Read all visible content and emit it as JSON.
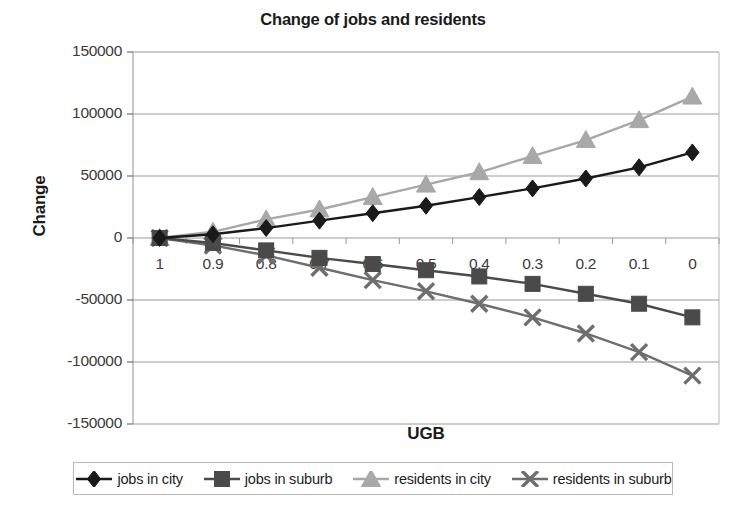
{
  "chart_data": {
    "type": "line",
    "title": "Change of jobs and residents",
    "xlabel": "UGB",
    "ylabel": "Change",
    "categories": [
      "1",
      "0.9",
      "0.8",
      "0.7",
      "0.6",
      "0.5",
      "0.4",
      "0.3",
      "0.2",
      "0.1",
      "0"
    ],
    "ylim": [
      -150000,
      150000
    ],
    "ytick_labels": [
      "150000",
      "100000",
      "50000",
      "0",
      "-50000",
      "-100000",
      "-150000"
    ],
    "ytick_values": [
      150000,
      100000,
      50000,
      0,
      -50000,
      -100000,
      -150000
    ],
    "grid": true,
    "legend_position": "bottom",
    "series": [
      {
        "name": "jobs in city",
        "marker": "diamond",
        "color": "#1a1a1a",
        "values": [
          0,
          3000,
          8000,
          14000,
          20000,
          26000,
          33000,
          40000,
          48000,
          57000,
          69000
        ]
      },
      {
        "name": "jobs in suburb",
        "marker": "square",
        "color": "#4a4a4a",
        "values": [
          0,
          -4000,
          -10000,
          -16000,
          -21000,
          -26000,
          -31000,
          -37000,
          -45000,
          -53000,
          -64000
        ]
      },
      {
        "name": "residents in city",
        "marker": "triangle",
        "color": "#a8a8a8",
        "values": [
          0,
          5000,
          15000,
          23000,
          33000,
          43000,
          53000,
          66000,
          79000,
          95000,
          114000
        ]
      },
      {
        "name": "residents in suburb",
        "marker": "cross",
        "color": "#6e6e6e",
        "values": [
          0,
          -6000,
          -14000,
          -24000,
          -34000,
          -43000,
          -53000,
          -64000,
          -77000,
          -92000,
          -111000
        ]
      }
    ]
  },
  "legend": {
    "items": [
      {
        "label": "jobs in city"
      },
      {
        "label": "jobs in suburb"
      },
      {
        "label": "residents in city"
      },
      {
        "label": "residents in suburb"
      }
    ]
  }
}
